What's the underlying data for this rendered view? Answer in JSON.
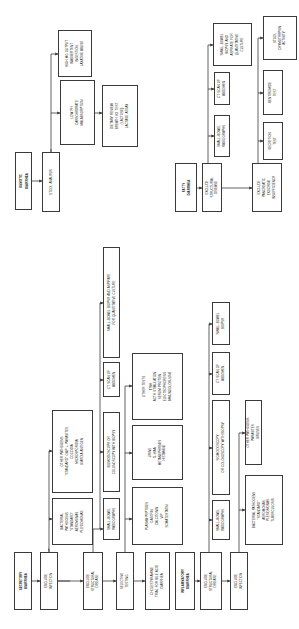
{
  "diagram": {
    "orientation": "rotated 90 degrees counterclockwise",
    "colors": {
      "line": "#3a3a3a",
      "background": "#ffffff",
      "text": "#222222"
    },
    "secretory": {
      "root": [
        "Secretory",
        "diarrhea"
      ],
      "exclude_infection": [
        "Exclude",
        "infection"
      ],
      "bacterial_pathogens": [
        "Bacterial",
        "pathogens",
        "\"Standard\"",
        "Aeromonas",
        "Plesiomonas"
      ],
      "other_pathogens": [
        "Other pathogens",
        "\"Standard\" O&P + parasites",
        "Coccidia",
        "Microsporidia",
        "Giardia antigen"
      ],
      "exclude_structural": [
        "Exclude",
        "structural",
        "disease"
      ],
      "small_bowel_radiographs": [
        "Small-bowel",
        "radiographs"
      ],
      "sigmoidoscopy": [
        "Sigmoidoscopy or",
        "colonoscopy with biopsy"
      ],
      "ct_scan": [
        "CT scan of",
        "abdomen"
      ],
      "small_bowel_biopsy": [
        "Small-bowel biopsy and aspirate",
        "for quantitative culture"
      ],
      "selective_testing": [
        "Selective",
        "testing"
      ],
      "plasma_peptides": [
        "Plasma peptides",
        "Gastrin",
        "Calcitonin",
        "VIP",
        "Somatostatin"
      ],
      "urine": [
        "Urine",
        "5-HIAA",
        "Metanephrines",
        "Histamine"
      ],
      "other_tests": [
        "Other tests",
        "TSH",
        "ACTH stimulation",
        "Serum protein",
        "electrophoresis",
        "Immunoglobulins"
      ],
      "cholestyramine": [
        "Cholestyramine",
        "trial for bile acid",
        "diarrhea"
      ]
    },
    "inflammatory": {
      "root": [
        "Inflammatory",
        "diarrhea"
      ],
      "exclude_structural": [
        "Exclude",
        "structural",
        "disease"
      ],
      "small_bowel_radiographs": [
        "Small-bowel",
        "radiographs"
      ],
      "sigmoidoscopy": [
        "Sigmoidoscopy",
        "or colonoscopy with biopsy"
      ],
      "ct_scan": [
        "CT scan of",
        "abdomen"
      ],
      "small_bowel_biopsy": [
        "Small-bowel",
        "biopsy"
      ],
      "exclude_infection": [
        "Exclude",
        "infection"
      ],
      "bacterial_pathogens": [
        "Bacterial pathogens",
        "\"Standard\"",
        "Aeromonas",
        "Plesiomonas",
        "Tuberculosis"
      ],
      "other_pathogens": [
        "Other pathogens",
        "Parasites",
        "Viruses"
      ]
    },
    "osmotic": {
      "root": [
        "Osmotic",
        "diarrhea"
      ],
      "stool_analysis": [
        "Stool analysis"
      ],
      "low_ph": [
        "Low pH",
        "Carbohydrate",
        "malabsorption"
      ],
      "high_mg": [
        "High Mg output",
        "Inadvertent",
        "ingestion",
        "Laxative abuse"
      ],
      "dietary_review": [
        "Dietary review",
        "Breath H2 test",
        "(lactose)",
        "Lactase assay"
      ]
    },
    "fatty": {
      "root": [
        "Fatty",
        "diarrhea"
      ],
      "exclude_structural": [
        "Exclude",
        "structural",
        "disease"
      ],
      "small_bowel_radiographs": [
        "Small-bowel",
        "radiographs"
      ],
      "ct_scan": [
        "CT scan of",
        "abdomen"
      ],
      "small_bowel_biopsy": [
        "Small-bowel",
        "biopsy and",
        "aspirate for",
        "quantitative",
        "culture"
      ],
      "exclude_pancreatic": [
        "Exclude",
        "pancreatic",
        "exocrine",
        "insufficiency"
      ],
      "secretion_test": [
        "Secretion",
        "test"
      ],
      "bentiromide_test": [
        "Bentiromide",
        "test"
      ],
      "stool_chymotrypsin": [
        "Stool",
        "chymotrypsin",
        "activity"
      ]
    }
  }
}
